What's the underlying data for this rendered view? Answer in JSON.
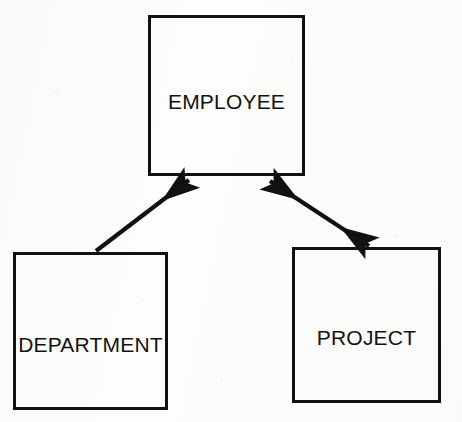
{
  "diagram": {
    "type": "entity-relationship",
    "background_color": "#fdfdfc",
    "stroke_color": "#111111",
    "entities": [
      {
        "id": "employee",
        "label": "EMPLOYEE",
        "x": 148,
        "y": 15,
        "width": 157,
        "height": 161
      },
      {
        "id": "department",
        "label": "DEPARTMENT",
        "x": 13,
        "y": 252,
        "width": 155,
        "height": 158
      },
      {
        "id": "project",
        "label": "PROJECT",
        "x": 292,
        "y": 247,
        "width": 149,
        "height": 156
      }
    ],
    "connectors": [
      {
        "id": "department-to-employee",
        "from": "department",
        "to": "employee",
        "label": "",
        "arrowheads": "single",
        "direction": "to-employee",
        "x1": 96,
        "y1": 251,
        "x2": 192,
        "y2": 178
      },
      {
        "id": "employee-project",
        "from": "employee",
        "to": "project",
        "label": "",
        "arrowheads": "double",
        "direction": "bidirectional",
        "x1": 267,
        "y1": 179,
        "x2": 369,
        "y2": 247
      }
    ]
  }
}
